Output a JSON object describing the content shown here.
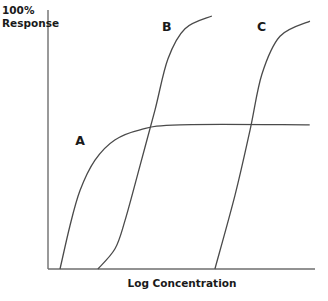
{
  "chart_data": {
    "type": "line",
    "title": "",
    "xlabel": "Log Concentration",
    "ylabel_line1": "100%",
    "ylabel_line2": "Response",
    "xlim": [
      0,
      10
    ],
    "ylim": [
      0,
      100
    ],
    "grid": false,
    "legend": "none",
    "series": [
      {
        "name": "A",
        "label_at": [
          1.2,
          49
        ],
        "points": [
          [
            0.45,
            0
          ],
          [
            0.82,
            17
          ],
          [
            1.2,
            31
          ],
          [
            1.76,
            43
          ],
          [
            2.5,
            51
          ],
          [
            3.45,
            55
          ],
          [
            4.94,
            57
          ],
          [
            9.8,
            57
          ]
        ]
      },
      {
        "name": "B",
        "label_at": [
          4.45,
          94
        ],
        "points": [
          [
            1.87,
            0
          ],
          [
            2.51,
            8
          ],
          [
            2.88,
            19
          ],
          [
            3.45,
            41
          ],
          [
            4.01,
            63
          ],
          [
            4.49,
            83
          ],
          [
            5.13,
            95
          ],
          [
            6.14,
            100
          ]
        ]
      },
      {
        "name": "C",
        "label_at": [
          8.0,
          94
        ],
        "points": [
          [
            6.25,
            0
          ],
          [
            7.0,
            29
          ],
          [
            7.57,
            55
          ],
          [
            8.01,
            77
          ],
          [
            8.69,
            92
          ],
          [
            9.81,
            98
          ]
        ]
      }
    ]
  }
}
